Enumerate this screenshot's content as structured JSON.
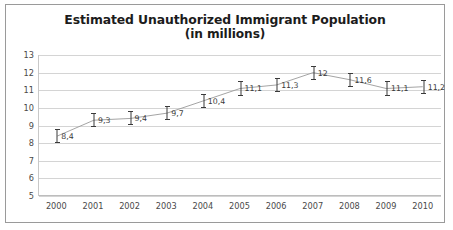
{
  "chart_data": {
    "type": "line",
    "title": "Estimated Unauthorized Immigrant Population",
    "subtitle": "(in millions)",
    "xlabel": "",
    "ylabel": "",
    "categories": [
      "2000",
      "2001",
      "2002",
      "2003",
      "2004",
      "2005",
      "2006",
      "2007",
      "2008",
      "2009",
      "2010"
    ],
    "values": [
      8.4,
      9.3,
      9.4,
      9.7,
      10.4,
      11.1,
      11.3,
      12,
      11.6,
      11.1,
      11.2
    ],
    "point_labels": [
      "8,4",
      "9,3",
      "9,4",
      "9,7",
      "10,4",
      "11,1",
      "11,3",
      "12",
      "11,6",
      "11,1",
      "11,2"
    ],
    "error_low": [
      8.0,
      8.9,
      9.0,
      9.3,
      10.0,
      10.7,
      10.9,
      11.6,
      11.2,
      10.7,
      10.8
    ],
    "error_high": [
      8.8,
      9.7,
      9.8,
      10.1,
      10.8,
      11.5,
      11.7,
      12.4,
      12.0,
      11.5,
      11.6
    ],
    "ylim": [
      5,
      13
    ],
    "yticks": [
      5,
      6,
      7,
      8,
      9,
      10,
      11,
      12,
      13
    ],
    "ytick_labels": [
      "5",
      "6",
      "7",
      "8",
      "9",
      "10",
      "11",
      "12",
      "13"
    ],
    "grid": true,
    "legend": false,
    "series_color": "#9a9a9a",
    "marker_color": "#3a3a3a",
    "gridline_color": "#d4d4d4",
    "border_color": "#9a9a9a",
    "background": "#ffffff"
  }
}
